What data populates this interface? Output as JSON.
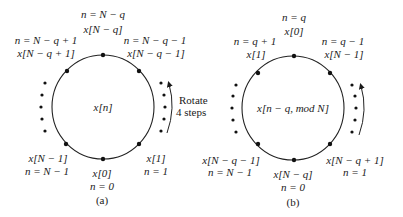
{
  "panel_a": {
    "caption": "(a)",
    "center_label": "x[n]",
    "circle": {
      "cx": 103,
      "cy": 107,
      "r": 51
    },
    "points": [
      {
        "id": "top",
        "x": 103,
        "y": 56,
        "n_label": "n = N − q",
        "x_label": "x[N − q]"
      },
      {
        "id": "upper-left",
        "x": 67,
        "y": 71,
        "n_label": "n = N − q + 1",
        "x_label": "x[N − q + 1]"
      },
      {
        "id": "upper-right",
        "x": 139,
        "y": 71,
        "n_label": "n = N − q − 1",
        "x_label": "x[N − q − 1]"
      },
      {
        "id": "lower-left",
        "x": 66,
        "y": 144,
        "n_label": "n = N − 1",
        "x_label": "x[N − 1]"
      },
      {
        "id": "bottom",
        "x": 102,
        "y": 159,
        "n_label": "n = 0",
        "x_label": "x[0]"
      },
      {
        "id": "lower-right",
        "x": 138,
        "y": 144,
        "n_label": "n = 1",
        "x_label": "x[1]"
      }
    ],
    "rotation_label_line1": "Rotate",
    "rotation_label_line2": "4 steps"
  },
  "panel_b": {
    "caption": "(b)",
    "center_label": "x[n − q, mod N]",
    "circle": {
      "cx": 293,
      "cy": 108,
      "r": 51
    },
    "points": [
      {
        "id": "top",
        "x": 294,
        "y": 56,
        "n_label": "n = q",
        "x_label": "x[0]"
      },
      {
        "id": "upper-left",
        "x": 258,
        "y": 73,
        "n_label": "n = q + 1",
        "x_label": "x[1]"
      },
      {
        "id": "upper-right",
        "x": 330,
        "y": 73,
        "n_label": "n = q − 1",
        "x_label": "x[N − 1]"
      },
      {
        "id": "lower-left",
        "x": 258,
        "y": 144,
        "n_label": "n = N − 1",
        "x_label": "x[N − q − 1]"
      },
      {
        "id": "bottom",
        "x": 294,
        "y": 161,
        "n_label": "n = 0",
        "x_label": "x[N − q]"
      },
      {
        "id": "lower-right",
        "x": 330,
        "y": 144,
        "n_label": "n = 1",
        "x_label": "x[N − q + 1]"
      }
    ]
  }
}
